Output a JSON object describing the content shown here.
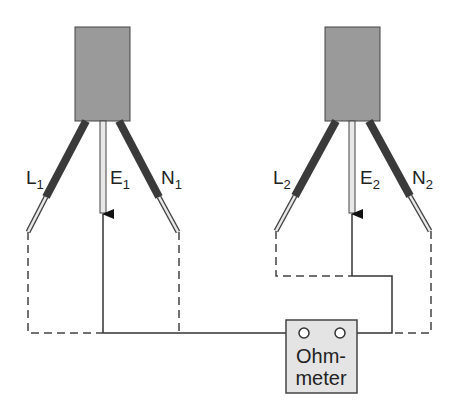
{
  "diagram": {
    "title": "",
    "appliances": [
      {
        "id": "appliance-1",
        "wires": [
          {
            "name": "L",
            "sub": "1"
          },
          {
            "name": "E",
            "sub": "1"
          },
          {
            "name": "N",
            "sub": "1"
          }
        ]
      },
      {
        "id": "appliance-2",
        "wires": [
          {
            "name": "L",
            "sub": "2"
          },
          {
            "name": "E",
            "sub": "2"
          },
          {
            "name": "N",
            "sub": "2"
          }
        ]
      }
    ],
    "meter": {
      "line1": "Ohm-",
      "line2": "meter"
    },
    "colors": {
      "plug_body": "#9a9a9a",
      "insulation": "#3a3a3a",
      "meter_fill": "#e4e4e4",
      "line": "#333333"
    }
  }
}
